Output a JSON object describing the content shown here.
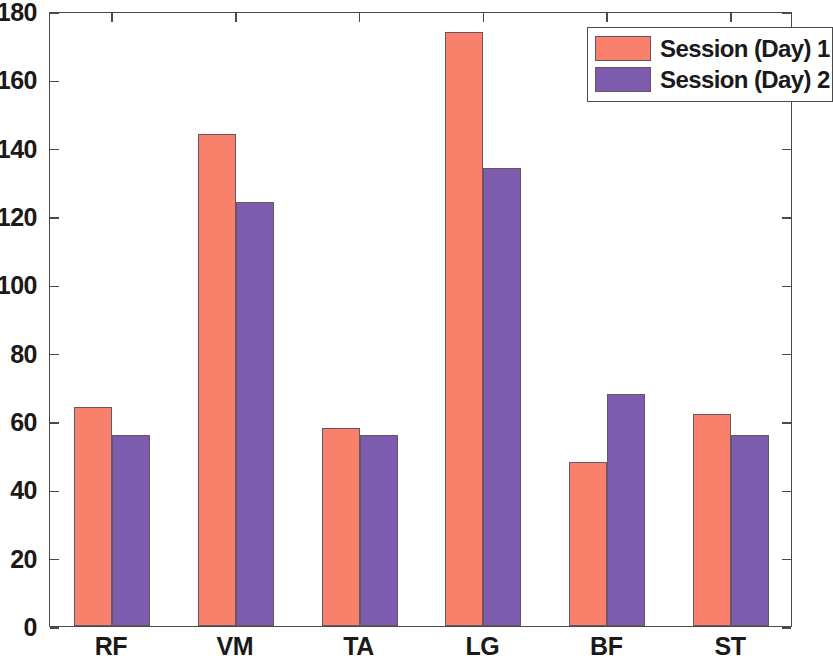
{
  "chart_data": {
    "type": "bar",
    "title": "",
    "xlabel": "",
    "ylabel": "",
    "categories": [
      "RF",
      "VM",
      "TA",
      "LG",
      "BF",
      "ST"
    ],
    "series": [
      {
        "name": "Session (Day) 1",
        "color": "#f9806b",
        "values": [
          64,
          144,
          58,
          174,
          48,
          62
        ]
      },
      {
        "name": "Session (Day) 2",
        "color": "#7d5cb0",
        "values": [
          56,
          124,
          56,
          134,
          68,
          56
        ]
      }
    ],
    "ylim": [
      0,
      180
    ],
    "yticks": [
      0,
      20,
      40,
      60,
      80,
      100,
      120,
      140,
      160,
      180
    ],
    "ytick_labels": [
      "0",
      "20",
      "40",
      "60",
      "80",
      "100",
      "120",
      "140",
      "160",
      "180"
    ],
    "grid": false,
    "legend_position": "top-right",
    "legend_entries": [
      "Session (Day) 1",
      "Session (Day) 2"
    ]
  }
}
